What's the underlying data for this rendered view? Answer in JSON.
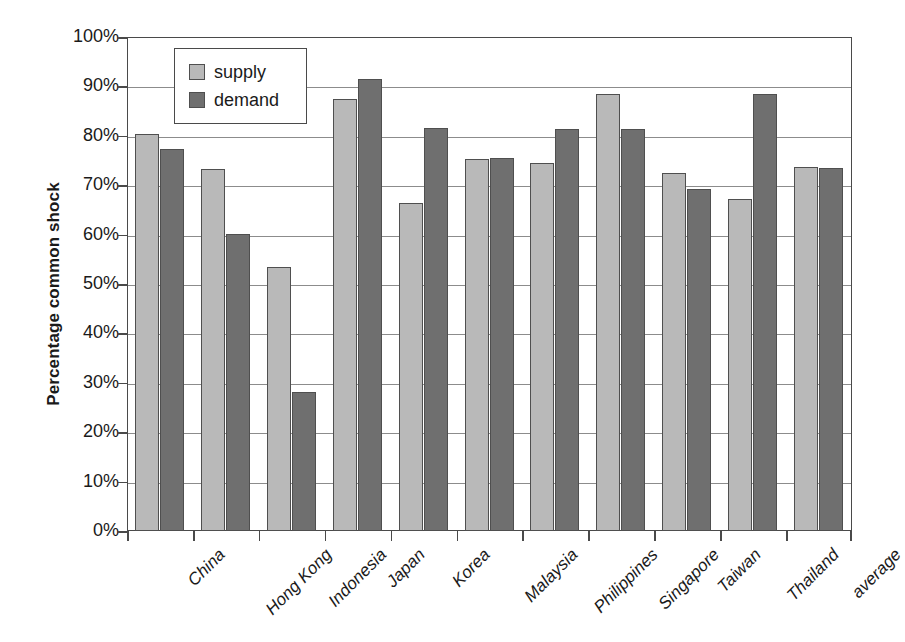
{
  "chart_data": {
    "type": "bar",
    "title": "",
    "xlabel": "",
    "ylabel": "Percentage common shock",
    "ylim": [
      0,
      100
    ],
    "grid": true,
    "legend_position": "top-left-inside",
    "y_tick_labels": [
      "100%",
      "90%",
      "80%",
      "70%",
      "60%",
      "50%",
      "40%",
      "30%",
      "20%",
      "10%",
      "0%"
    ],
    "y_tick_values": [
      100,
      90,
      80,
      70,
      60,
      50,
      40,
      30,
      20,
      10,
      0
    ],
    "categories": [
      "China",
      "Hong Kong",
      "Indonesia",
      "Japan",
      "Korea",
      "Malaysia",
      "Philippines",
      "Singapore",
      "Taiwan",
      "Thailand",
      "average"
    ],
    "series": [
      {
        "name": "supply",
        "color": "#b9b9b9",
        "values": [
          80.3,
          73.3,
          53.5,
          87.5,
          66.3,
          75.4,
          74.4,
          88.4,
          72.5,
          67.3,
          73.7
        ]
      },
      {
        "name": "demand",
        "color": "#6f6f6f",
        "values": [
          77.3,
          60.1,
          28.1,
          91.4,
          81.5,
          75.6,
          81.4,
          81.4,
          69.2,
          88.4,
          73.5
        ]
      }
    ]
  },
  "legend": {
    "items": [
      {
        "label": "supply",
        "swatch": "supply"
      },
      {
        "label": "demand",
        "swatch": "demand"
      }
    ]
  },
  "axis": {
    "y_title": "Percentage common shock"
  }
}
